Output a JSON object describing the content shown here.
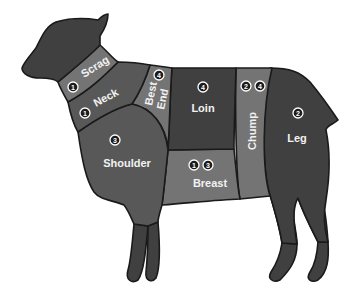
{
  "diagram": {
    "colors": {
      "outline": "#1a1a1a",
      "dark": "#404040",
      "medium": "#585858",
      "light": "#747474",
      "badge_fill": "#1c1c1c",
      "badge_ring": "#ffffff",
      "label_text": "#f2f2f2"
    },
    "cuts": [
      {
        "id": "scrag",
        "label": "Scrag",
        "badges": [
          "1"
        ]
      },
      {
        "id": "neck",
        "label": "Neck",
        "badges": [
          "1"
        ]
      },
      {
        "id": "best-end",
        "label_line1": "Best",
        "label_line2": "End",
        "badges": [
          "4"
        ]
      },
      {
        "id": "loin",
        "label": "Loin",
        "badges": [
          "4"
        ]
      },
      {
        "id": "chump",
        "label": "Chump",
        "badges": [
          "2",
          "4"
        ]
      },
      {
        "id": "leg",
        "label": "Leg",
        "badges": [
          "2"
        ]
      },
      {
        "id": "shoulder",
        "label": "Shoulder",
        "badges": [
          "3"
        ]
      },
      {
        "id": "breast",
        "label": "Breast",
        "badges": [
          "1",
          "3"
        ]
      }
    ]
  }
}
